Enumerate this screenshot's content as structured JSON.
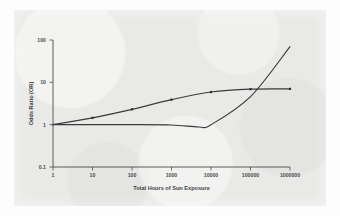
{
  "figure": {
    "background_color": "#e9e9e7",
    "page_color": "#ffffff",
    "ink_color": "#3a3a3a"
  },
  "chart_data": {
    "type": "line",
    "title": "",
    "subtitle": "",
    "xlabel": "Total Hours of Sun Exposure",
    "ylabel": "Odds Ratio (OR)",
    "xscale": "log",
    "yscale": "log",
    "xlim": [
      1,
      1000000
    ],
    "ylim": [
      0.1,
      100
    ],
    "xticks": [
      1,
      10,
      100,
      1000,
      10000,
      100000,
      1000000
    ],
    "xticklabels": [
      "1",
      "10",
      "100",
      "1000",
      "10000",
      "100000",
      "1000000"
    ],
    "yticks": [
      0.1,
      1,
      10,
      100
    ],
    "yticklabels": [
      "0.1",
      "1",
      "10",
      "100"
    ],
    "grid": false,
    "legend": false,
    "legend_position": "none",
    "annotations": [],
    "series": [
      {
        "name": "Cumulative exposure (plateau)",
        "marker": "dot",
        "x": [
          1,
          10,
          100,
          1000,
          10000,
          100000,
          1000000
        ],
        "values": [
          1.0,
          1.45,
          2.3,
          3.9,
          5.9,
          6.9,
          7.0
        ]
      },
      {
        "name": "Intermittent exposure (J-shaped)",
        "marker": "none",
        "x": [
          1,
          10,
          100,
          1000,
          5000,
          10000,
          100000,
          1000000
        ],
        "values": [
          1.0,
          1.0,
          1.0,
          0.98,
          0.88,
          1.0,
          4.6,
          70.0
        ]
      }
    ]
  }
}
